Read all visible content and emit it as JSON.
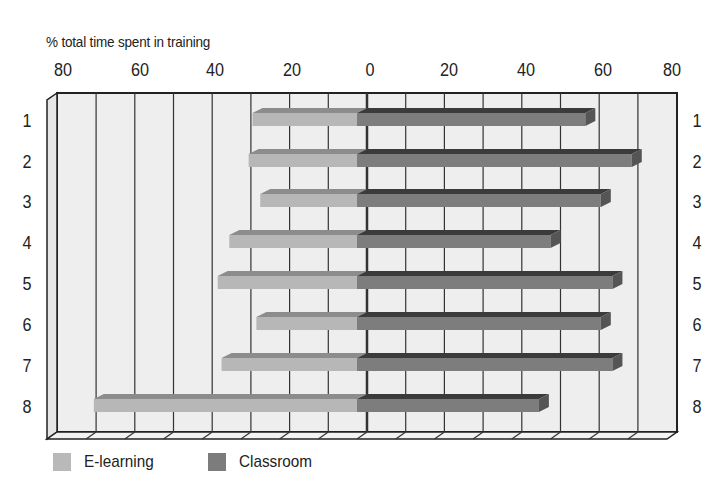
{
  "chart": {
    "subtitle": "% total time spent in training",
    "top_ticks": [
      {
        "label": "80",
        "x": 63
      },
      {
        "label": "60",
        "x": 140
      },
      {
        "label": "40",
        "x": 215
      },
      {
        "label": "20",
        "x": 292
      },
      {
        "label": "0",
        "x": 370
      },
      {
        "label": "20",
        "x": 449
      },
      {
        "label": "40",
        "x": 526
      },
      {
        "label": "60",
        "x": 603
      },
      {
        "label": "80",
        "x": 672
      }
    ],
    "row_labels": [
      "1",
      "2",
      "3",
      "4",
      "5",
      "6",
      "7",
      "8"
    ],
    "legend": [
      {
        "label": "E-learning",
        "color": "#b9b9b9"
      },
      {
        "label": "Classroom",
        "color": "#7c7c7c"
      }
    ],
    "colors": {
      "background_plane": "#eeeeee",
      "elearning_front": "#b7b7b7",
      "elearning_top": "#8c8c8c",
      "classroom_front": "#7d7d7d",
      "classroom_top": "#3b3b3b",
      "classroom_end": "#555555",
      "grid": "#333333"
    }
  },
  "chart_data": {
    "type": "bar",
    "orientation": "horizontal",
    "style": "3d-diverging",
    "title": "",
    "xlabel": "% total time spent in training",
    "ylabel": "",
    "categories": [
      "1",
      "2",
      "3",
      "4",
      "5",
      "6",
      "7",
      "8"
    ],
    "series": [
      {
        "name": "E-learning",
        "direction": "left",
        "values": [
          27,
          28,
          25,
          33,
          36,
          26,
          35,
          68
        ]
      },
      {
        "name": "Classroom",
        "direction": "right",
        "values": [
          59,
          71,
          63,
          50,
          66,
          63,
          66,
          47
        ]
      }
    ],
    "xlim": [
      -80,
      80
    ],
    "x_tick_labels": [
      "80",
      "60",
      "40",
      "20",
      "0",
      "20",
      "40",
      "60",
      "80"
    ],
    "grid": {
      "vertical": true,
      "step": 10
    },
    "legend_position": "bottom-left"
  }
}
